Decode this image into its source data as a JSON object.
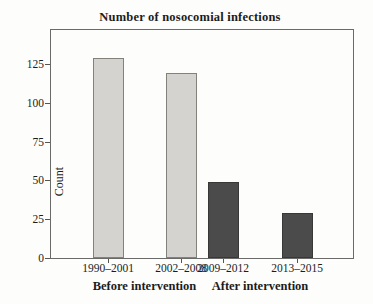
{
  "chart_data": {
    "type": "bar",
    "title": "Number of nosocomial infections",
    "xlabel": "",
    "ylabel": "Count",
    "ylim": [
      0,
      140
    ],
    "yticks": [
      0,
      25,
      50,
      75,
      100,
      125
    ],
    "categories": [
      "1990–2001",
      "2002–2008",
      "2009–2012",
      "2013–2015"
    ],
    "values": [
      129,
      119,
      49,
      29
    ],
    "series": [
      {
        "name": "Before intervention",
        "bar_indices": [
          0,
          1
        ],
        "fill": "#d4d3d0",
        "border": "#82827a"
      },
      {
        "name": "After intervention",
        "bar_indices": [
          2,
          3
        ],
        "fill": "#4b4b4b",
        "border": "#383838"
      }
    ],
    "group_labels": [
      "Before intervention",
      "After intervention"
    ],
    "legend_position": "none",
    "grid": false,
    "frame": true
  },
  "colors": {
    "background": "#fdfdfc",
    "frame_border": "#6a6a68",
    "text": "#1c1c1c",
    "before_bar_fill": "#d4d3d0",
    "before_bar_border": "#82827a",
    "after_bar_fill": "#4b4b4b",
    "after_bar_border": "#383838"
  }
}
